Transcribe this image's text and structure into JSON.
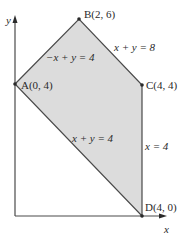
{
  "diagram": {
    "type": "feasible-region",
    "colors": {
      "region_fill": "#dcdcdc",
      "region_edge": "#4a4a4a",
      "axis": "#4a4a4a",
      "text": "#2a2a2a",
      "background": "#ffffff"
    },
    "axes": {
      "x_label": "x",
      "y_label": "y"
    },
    "vertices": [
      {
        "id": "A",
        "label": "A(0, 4)",
        "x": 0,
        "y": 4
      },
      {
        "id": "B",
        "label": "B(2, 6)",
        "x": 2,
        "y": 6
      },
      {
        "id": "C",
        "label": "C(4, 4)",
        "x": 4,
        "y": 4
      },
      {
        "id": "D",
        "label": "D(4, 0)",
        "x": 4,
        "y": 0
      }
    ],
    "constraints": [
      {
        "id": "ab",
        "label": "−x + y = 4"
      },
      {
        "id": "bc",
        "label": "x + y = 8"
      },
      {
        "id": "cd",
        "label": "x = 4"
      },
      {
        "id": "ad",
        "label": "x + y = 4"
      }
    ]
  }
}
